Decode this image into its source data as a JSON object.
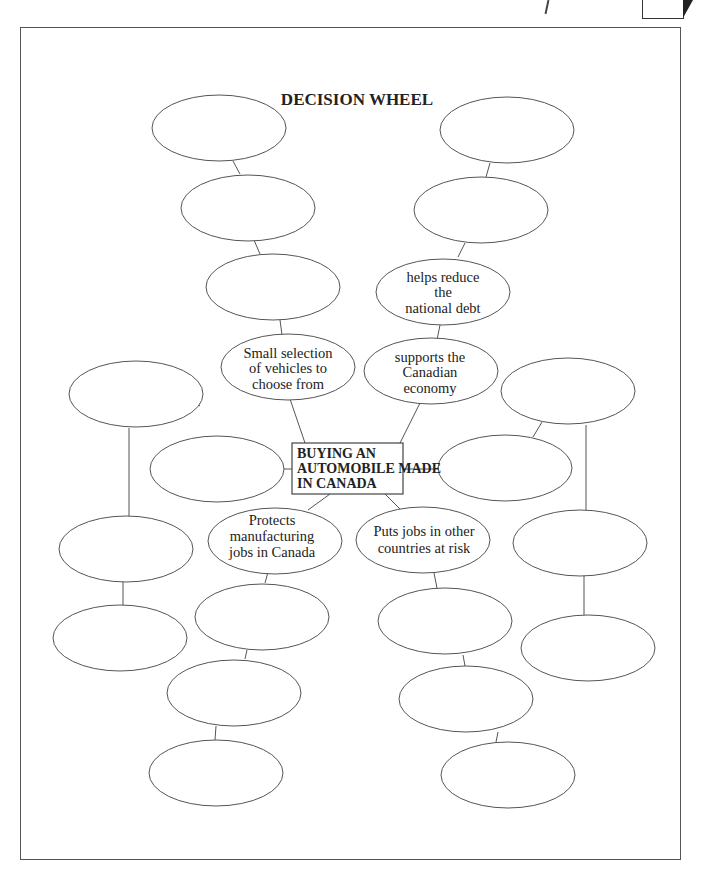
{
  "title": "DECISION WHEEL",
  "center": {
    "lines": [
      "BUYING AN",
      "AUTOMOBILE MADE",
      "IN CANADA"
    ]
  },
  "nodes": {
    "upper_left_3": {
      "lines": [
        "Small selection",
        "of vehicles to",
        "choose from"
      ]
    },
    "upper_right_3": {
      "lines": [
        "supports the",
        "Canadian",
        "economy"
      ]
    },
    "upper_right_2": {
      "lines": [
        "helps reduce",
        "the",
        "national debt"
      ]
    },
    "lower_left_1": {
      "lines": [
        "Protects",
        "manufacturing",
        "jobs in Canada"
      ]
    },
    "lower_right_1": {
      "lines": [
        "Puts jobs in other",
        "countries at risk"
      ]
    }
  },
  "empty_oval_count": 19,
  "colors": {
    "stroke": "#555555",
    "text": "#222222",
    "background": "#ffffff"
  }
}
